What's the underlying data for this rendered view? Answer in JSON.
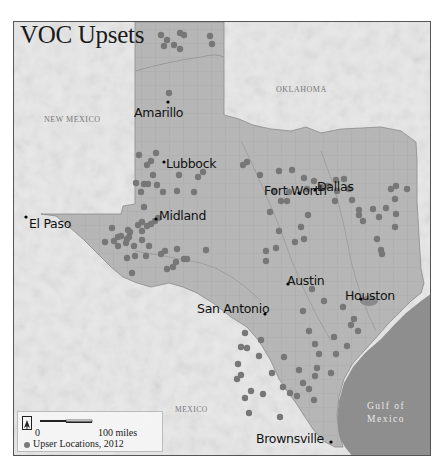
{
  "title": "VOC Upsets",
  "regions": {
    "new_mexico": "NEW MEXICO",
    "oklahoma": "OKLAHOMA",
    "mexico": "MEXICO",
    "gulf_line1": "Gulf of",
    "gulf_line2": "Mexico"
  },
  "cities": [
    {
      "name": "Amarillo",
      "x": 167,
      "y": 101
    },
    {
      "name": "Lubbock",
      "x": 163,
      "y": 161
    },
    {
      "name": "El Paso",
      "x": 25,
      "y": 216
    },
    {
      "name": "Midland",
      "x": 155,
      "y": 218
    },
    {
      "name": "Fort Worth",
      "x": 298,
      "y": 192
    },
    {
      "name": "Dallas",
      "x": 314,
      "y": 189
    },
    {
      "name": "Austin",
      "x": 287,
      "y": 283
    },
    {
      "name": "Houston",
      "x": 360,
      "y": 298
    },
    {
      "name": "San Antonio",
      "x": 264,
      "y": 313
    },
    {
      "name": "Brownsville",
      "x": 330,
      "y": 441
    }
  ],
  "legend": {
    "scale_start": "0",
    "scale_end": "100 miles",
    "symbol_label": "Upser Locations, 2012",
    "north_icon": "north-arrow-icon"
  },
  "colors": {
    "texas_fill": "#b4b4b4",
    "relief_fill": "#e6e6e6",
    "gulf_fill": "#8e8e8e",
    "dot_fill": "#777777",
    "frame": "#555555"
  },
  "upset_points": [
    [
      160,
      34
    ],
    [
      179,
      32
    ],
    [
      183,
      34
    ],
    [
      166,
      39
    ],
    [
      163,
      45
    ],
    [
      179,
      48
    ],
    [
      209,
      35
    ],
    [
      211,
      43
    ],
    [
      173,
      44
    ],
    [
      168,
      92
    ],
    [
      138,
      154
    ],
    [
      155,
      152
    ],
    [
      150,
      160
    ],
    [
      146,
      164
    ],
    [
      152,
      174
    ],
    [
      135,
      182
    ],
    [
      143,
      183
    ],
    [
      147,
      183
    ],
    [
      156,
      184
    ],
    [
      140,
      191
    ],
    [
      162,
      191
    ],
    [
      176,
      190
    ],
    [
      178,
      174
    ],
    [
      197,
      176
    ],
    [
      202,
      171
    ],
    [
      193,
      191
    ],
    [
      143,
      206
    ],
    [
      141,
      221
    ],
    [
      137,
      224
    ],
    [
      127,
      229
    ],
    [
      129,
      231
    ],
    [
      146,
      225
    ],
    [
      150,
      223
    ],
    [
      154,
      220
    ],
    [
      157,
      217
    ],
    [
      141,
      230
    ],
    [
      111,
      227
    ],
    [
      117,
      236
    ],
    [
      120,
      235
    ],
    [
      126,
      238
    ],
    [
      128,
      236
    ],
    [
      113,
      240
    ],
    [
      117,
      245
    ],
    [
      125,
      242
    ],
    [
      133,
      245
    ],
    [
      141,
      239
    ],
    [
      148,
      245
    ],
    [
      145,
      255
    ],
    [
      160,
      253
    ],
    [
      164,
      250
    ],
    [
      176,
      248
    ],
    [
      175,
      261
    ],
    [
      183,
      258
    ],
    [
      172,
      266
    ],
    [
      104,
      241
    ],
    [
      126,
      257
    ],
    [
      131,
      272
    ],
    [
      134,
      255
    ],
    [
      166,
      268
    ],
    [
      186,
      258
    ],
    [
      205,
      249
    ],
    [
      242,
      164
    ],
    [
      246,
      161
    ],
    [
      259,
      174
    ],
    [
      278,
      170
    ],
    [
      291,
      169
    ],
    [
      303,
      177
    ],
    [
      313,
      180
    ],
    [
      320,
      186
    ],
    [
      327,
      185
    ],
    [
      306,
      188
    ],
    [
      288,
      191
    ],
    [
      273,
      190
    ],
    [
      286,
      200
    ],
    [
      280,
      200
    ],
    [
      269,
      211
    ],
    [
      307,
      214
    ],
    [
      300,
      226
    ],
    [
      303,
      238
    ],
    [
      278,
      230
    ],
    [
      275,
      247
    ],
    [
      265,
      250
    ],
    [
      265,
      260
    ],
    [
      294,
      241
    ],
    [
      335,
      179
    ],
    [
      343,
      178
    ],
    [
      348,
      188
    ],
    [
      336,
      190
    ],
    [
      334,
      200
    ],
    [
      351,
      199
    ],
    [
      358,
      209
    ],
    [
      358,
      214
    ],
    [
      362,
      220
    ],
    [
      372,
      208
    ],
    [
      378,
      216
    ],
    [
      385,
      207
    ],
    [
      394,
      198
    ],
    [
      395,
      213
    ],
    [
      394,
      226
    ],
    [
      376,
      238
    ],
    [
      380,
      249
    ],
    [
      381,
      253
    ],
    [
      406,
      188
    ],
    [
      395,
      185
    ],
    [
      390,
      188
    ],
    [
      302,
      310
    ],
    [
      311,
      288
    ],
    [
      323,
      300
    ],
    [
      342,
      306
    ],
    [
      350,
      324
    ],
    [
      353,
      318
    ],
    [
      357,
      330
    ],
    [
      333,
      336
    ],
    [
      314,
      343
    ],
    [
      318,
      353
    ],
    [
      335,
      353
    ],
    [
      346,
      345
    ],
    [
      308,
      330
    ],
    [
      244,
      332
    ],
    [
      246,
      347
    ],
    [
      258,
      355
    ],
    [
      240,
      346
    ],
    [
      260,
      339
    ],
    [
      237,
      363
    ],
    [
      240,
      374
    ],
    [
      250,
      390
    ],
    [
      244,
      397
    ],
    [
      248,
      412
    ],
    [
      262,
      393
    ],
    [
      289,
      392
    ],
    [
      296,
      395
    ],
    [
      308,
      388
    ],
    [
      302,
      382
    ],
    [
      314,
      375
    ],
    [
      313,
      399
    ],
    [
      279,
      416
    ],
    [
      282,
      386
    ],
    [
      298,
      369
    ],
    [
      316,
      367
    ],
    [
      330,
      372
    ],
    [
      236,
      378
    ],
    [
      271,
      372
    ],
    [
      283,
      356
    ]
  ]
}
